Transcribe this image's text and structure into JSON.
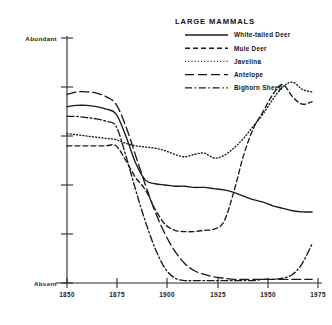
{
  "chart_data": {
    "type": "line",
    "title": "LARGE MAMMALS",
    "xlabel": "",
    "ylabel": "",
    "xlim": [
      1850,
      1978
    ],
    "ylim": [
      0,
      100
    ],
    "grid": false,
    "legend_position": "top-right",
    "x_ticks": [
      "1850",
      "1875",
      "1900",
      "1925",
      "1950",
      "1975"
    ],
    "x_tick_values": [
      1850,
      1875,
      1900,
      1925,
      1950,
      1975
    ],
    "y_axis_labels": {
      "top": "Abundant",
      "bottom": "Absent"
    },
    "y_tick_values": [
      0,
      20,
      40,
      60,
      80,
      100
    ],
    "x": [
      1850,
      1855,
      1860,
      1865,
      1870,
      1875,
      1880,
      1885,
      1890,
      1895,
      1900,
      1905,
      1910,
      1915,
      1920,
      1925,
      1930,
      1935,
      1940,
      1945,
      1950,
      1955,
      1960,
      1965,
      1970,
      1975
    ],
    "series": [
      {
        "name": "White-tailed Deer",
        "line_style": "solid",
        "values": [
          72,
          72.5,
          72.5,
          72,
          71,
          69,
          60,
          49,
          42,
          40.5,
          40,
          39.5,
          39.5,
          39,
          39,
          38.5,
          38,
          37,
          35.5,
          34,
          33,
          31.5,
          30.5,
          29.5,
          29,
          29
        ]
      },
      {
        "name": "Mule Deer",
        "line_style": "dashed",
        "values": [
          56,
          56,
          56,
          56,
          56,
          56,
          50,
          43,
          38,
          30,
          24,
          21.5,
          21,
          21,
          21.5,
          22,
          25,
          37,
          52,
          63,
          70,
          77,
          81,
          76,
          73,
          74
        ]
      },
      {
        "name": "Javelina",
        "line_style": "dotted",
        "values": [
          61,
          60.5,
          60,
          59.5,
          59,
          58.5,
          57,
          56,
          55.5,
          55,
          54,
          52.5,
          51.5,
          52.5,
          53,
          51,
          52,
          55,
          59,
          64,
          69,
          75,
          80,
          82,
          79,
          78
        ]
      },
      {
        "name": "Antelope",
        "line_style": "long-dash",
        "values": [
          77,
          78,
          78,
          77.5,
          76,
          73,
          64,
          52,
          40,
          29,
          20,
          13,
          8,
          5,
          3.5,
          2.5,
          2,
          1.5,
          1.5,
          1.5,
          1.5,
          1.5,
          1.5,
          1.5,
          1.5,
          1.5
        ]
      },
      {
        "name": "Bighorn Sheep",
        "line_style": "dash-dot",
        "values": [
          68,
          68,
          67.5,
          67,
          66,
          64,
          52,
          38,
          25,
          14,
          6,
          2,
          1,
          1,
          1,
          1,
          1,
          1,
          1,
          1,
          1.5,
          1.5,
          2,
          3.5,
          8,
          16
        ]
      }
    ]
  },
  "legend": {
    "title": "LARGE MAMMALS",
    "entries": [
      {
        "label": "White-tailed Deer",
        "style": "solid"
      },
      {
        "label": "Mule Deer",
        "style": "dashed"
      },
      {
        "label": "Javelina",
        "style": "dotted"
      },
      {
        "label": "Antelope",
        "style": "long-dash"
      },
      {
        "label": "Bighorn Sheep",
        "style": "dash-dot"
      }
    ]
  },
  "axes": {
    "y_top_label": "Abundant",
    "y_bottom_label": "Absent",
    "x_tick_labels": [
      "1850",
      "1875",
      "1900",
      "1925",
      "1950",
      "1975"
    ]
  },
  "colors": {
    "ink": "#1b1b1b",
    "background": "#ffffff"
  }
}
